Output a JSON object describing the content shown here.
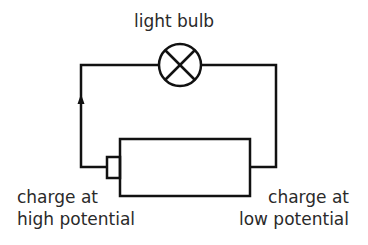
{
  "diagram": {
    "type": "circuit",
    "components": {
      "bulb": {
        "label": "light bulb",
        "symbol": "lamp-cross-circle"
      },
      "battery": {
        "symbol": "cell-with-positive-terminal"
      }
    },
    "labels": {
      "high": {
        "line1": "charge at",
        "line2": "high potential"
      },
      "low": {
        "line1": "charge at",
        "line2": "low potential"
      }
    },
    "current_direction": "up-left-wire",
    "colors": {
      "stroke": "#111111",
      "text": "#2a2a2a"
    }
  }
}
